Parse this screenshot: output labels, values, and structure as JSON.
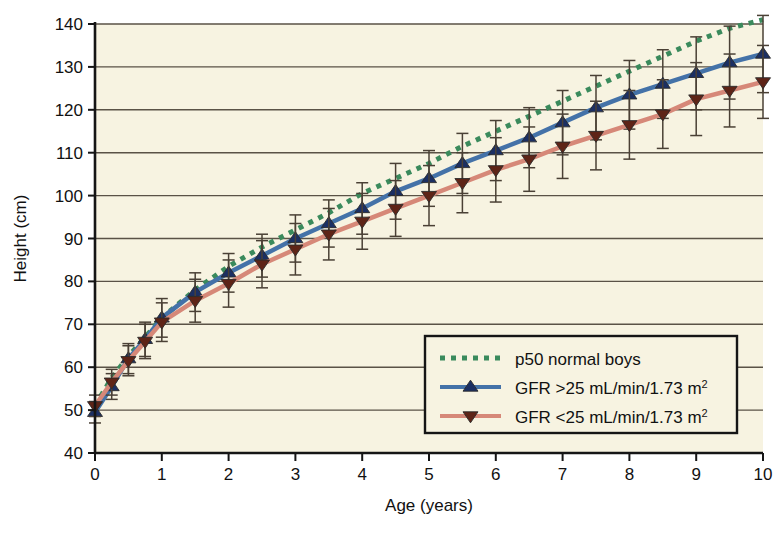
{
  "chart_data": {
    "type": "line",
    "title": "",
    "subtitle": "",
    "xlabel": "Age (years)",
    "ylabel": "Height (cm)",
    "xlim": [
      0,
      10
    ],
    "ylim": [
      40,
      140
    ],
    "xticks": [
      "0",
      "1",
      "2",
      "3",
      "4",
      "5",
      "6",
      "7",
      "8",
      "9",
      "10"
    ],
    "xtick_values": [
      0,
      1,
      2,
      3,
      4,
      5,
      6,
      7,
      8,
      9,
      10
    ],
    "yticks": [
      "40",
      "50",
      "60",
      "70",
      "80",
      "90",
      "100",
      "110",
      "120",
      "130",
      "140"
    ],
    "ytick_values": [
      40,
      50,
      60,
      70,
      80,
      90,
      100,
      110,
      120,
      130,
      140
    ],
    "grid": "horizontal",
    "legend_position": "inside-bottom-right",
    "plot_background": "#f7f3e1",
    "x": [
      0,
      0.25,
      0.5,
      0.75,
      1,
      1.5,
      2,
      2.5,
      3,
      3.5,
      4,
      4.5,
      5,
      5.5,
      6,
      6.5,
      7,
      7.5,
      8,
      8.5,
      9,
      9.5,
      10
    ],
    "series": [
      {
        "name": "p50 normal boys",
        "style": "dotted",
        "color": "#3a8a5c",
        "marker": "none",
        "errorbars": false,
        "values": [
          51,
          57.5,
          62.5,
          67,
          71.5,
          78,
          83.5,
          88,
          92,
          96,
          100.5,
          104,
          107.5,
          111.5,
          115,
          118.5,
          122,
          125.5,
          129,
          132.5,
          136,
          139,
          141
        ]
      },
      {
        "name": "GFR >25 mL/min/1.73 m2",
        "name_display": "GFR >25 mL/min/1.73 m",
        "name_superscript": "2",
        "style": "solid",
        "color": "#4472a8",
        "marker": "triangle-up",
        "marker_fill": "#1b2f63",
        "errorbars": true,
        "values": [
          49.5,
          55.5,
          62,
          66.5,
          71.5,
          77.5,
          82,
          86,
          90,
          93.5,
          97,
          101,
          104,
          107.5,
          110.5,
          113.5,
          117,
          120.5,
          123.5,
          126,
          128.5,
          131,
          133
        ],
        "err_low": [
          2.5,
          3,
          3.5,
          4,
          4.5,
          4.5,
          4.5,
          5,
          5.5,
          5.5,
          6,
          6.5,
          6.5,
          7,
          7,
          7,
          7.5,
          7.5,
          8,
          8,
          8.5,
          8.5,
          9
        ],
        "err_high": [
          2.5,
          3,
          3.5,
          4,
          4.5,
          4.5,
          4.5,
          5,
          5.5,
          5.5,
          6,
          6.5,
          6.5,
          7,
          7,
          7,
          7.5,
          7.5,
          8,
          8,
          8.5,
          8.5,
          9
        ]
      },
      {
        "name": "GFR <25 mL/min/1.73 m2",
        "name_display": "GFR <25 mL/min/1.73 m",
        "name_superscript": "2",
        "style": "solid",
        "color": "#d68878",
        "marker": "triangle-down",
        "marker_fill": "#5e2417",
        "errorbars": true,
        "values": [
          51,
          56.5,
          61.5,
          66,
          70.5,
          75.5,
          79.5,
          84,
          87.5,
          91,
          94,
          97,
          100,
          103,
          106,
          108.5,
          111.5,
          114,
          116.5,
          119,
          122.5,
          124.5,
          126.5
        ],
        "err_low": [
          2.5,
          3,
          3.5,
          4,
          4.5,
          5,
          5.5,
          5.5,
          6,
          6,
          6.5,
          6.5,
          7,
          7,
          7.5,
          7.5,
          7.5,
          8,
          8,
          8,
          8.5,
          8.5,
          8.5
        ],
        "err_high": [
          2.5,
          3,
          3.5,
          4,
          4.5,
          5,
          5.5,
          5.5,
          6,
          6,
          6.5,
          6.5,
          7,
          7,
          7.5,
          7.5,
          7.5,
          8,
          8,
          8,
          8.5,
          8.5,
          8.5
        ]
      }
    ],
    "legend": [
      {
        "label": "p50 normal boys",
        "sup": "",
        "color": "#3a8a5c",
        "style": "dotted",
        "marker": "none"
      },
      {
        "label": "GFR >25 mL/min/1.73 m",
        "sup": "2",
        "color": "#4472a8",
        "style": "solid",
        "marker": "triangle-up"
      },
      {
        "label": "GFR <25 mL/min/1.73 m",
        "sup": "2",
        "color": "#d68878",
        "style": "solid",
        "marker": "triangle-down"
      }
    ]
  }
}
